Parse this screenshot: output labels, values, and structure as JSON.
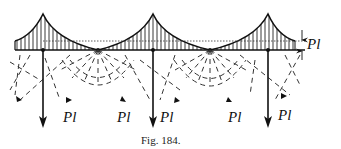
{
  "figure": {
    "caption": "Fig. 184.",
    "right_dimension_label": "Pl",
    "bottom_labels": [
      {
        "text": "Pl",
        "x": 63,
        "y": 110
      },
      {
        "text": "Pl",
        "x": 117,
        "y": 110
      },
      {
        "text": "Pl",
        "x": 171,
        "y": 112
      },
      {
        "text": "Pl",
        "x": 228,
        "y": 110
      },
      {
        "text": "Pl",
        "x": 278,
        "y": 109
      }
    ],
    "ink_color": "#111111",
    "background": "#ffffff"
  }
}
